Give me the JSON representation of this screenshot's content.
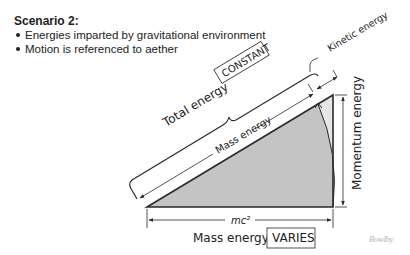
{
  "header": {
    "title": "Scenario 2:",
    "bullets": [
      "Energies imparted by gravitational environment",
      "Motion is referenced to aether"
    ]
  },
  "diagram": {
    "total_energy_label": "Total energy",
    "total_energy_status": "CONSTANT",
    "kinetic_energy_label": "Kinetic energy",
    "mass_energy_hyp_label": "Mass energy",
    "momentum_energy_label": "Momentum energy",
    "base_label": "mc²",
    "mass_energy_label": "Mass energy",
    "mass_energy_status": "VARIES",
    "colors": {
      "triangle_fill": "#c8c8c8",
      "sector_fill": "#b8b8b8",
      "line": "#2a2a2a"
    }
  },
  "watermark": "Rowlby"
}
